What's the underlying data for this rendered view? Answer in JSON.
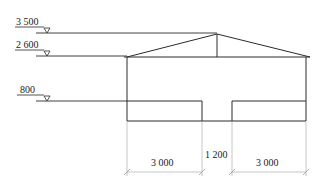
{
  "diagram": {
    "type": "building-elevation-section",
    "colors": {
      "line": "#2a2a2a",
      "dim_line": "#b8b8b8",
      "text": "#222222"
    },
    "levels": [
      {
        "label": "3 500",
        "y": 34
      },
      {
        "label": "2 600",
        "y": 57
      },
      {
        "label": "800",
        "y": 101
      }
    ],
    "dimensions": [
      {
        "label": "3 000",
        "from_x": 127,
        "to_x": 202
      },
      {
        "label": "1 200",
        "from_x": 202,
        "to_x": 232
      },
      {
        "label": "3 000",
        "from_x": 232,
        "to_x": 306
      }
    ]
  }
}
